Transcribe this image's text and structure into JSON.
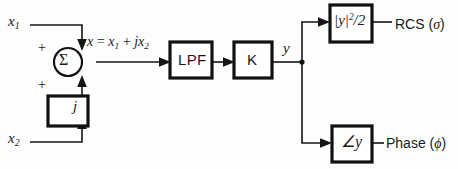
{
  "diagram": {
    "background_color": "#fdfdfd",
    "line_color": "#141414",
    "inputs": [
      {
        "id": "x1",
        "label": "x",
        "subscript": "1",
        "position": "top-left"
      },
      {
        "id": "x2",
        "label": "x",
        "subscript": "2",
        "position": "bottom-left"
      }
    ],
    "summing_junction": {
      "symbol": "Σ",
      "sign_top": "+",
      "sign_bottom": "+"
    },
    "signal_equation": {
      "lhs": "x",
      "eq": "=",
      "term1_base": "x",
      "term1_sub": "1",
      "plus": "+",
      "term2_prefix": "j",
      "term2_base": "x",
      "term2_sub": "2",
      "full": "x = x1 + jx2"
    },
    "blocks": [
      {
        "id": "gain-j",
        "label": "j",
        "style": "math-italic"
      },
      {
        "id": "lpf",
        "label": "LPF",
        "style": "plain"
      },
      {
        "id": "gain-k",
        "label": "K",
        "style": "plain"
      },
      {
        "id": "magnitude-squared",
        "label": "|y|²/2",
        "style": "math-italic"
      },
      {
        "id": "angle",
        "label": "∠y",
        "style": "math-italic"
      }
    ],
    "intermediate_signal": {
      "label": "y"
    },
    "outputs": [
      {
        "id": "rcs",
        "name": "RCS",
        "symbol": "σ",
        "full": "RCS (σ)"
      },
      {
        "id": "phase",
        "name": "Phase",
        "symbol": "ϕ",
        "full": "Phase (ϕ)"
      }
    ],
    "mag_block_text": {
      "bar_open": "|",
      "base": "y",
      "bar_close": "|",
      "exponent": "2",
      "divider": "/",
      "denominator": "2"
    },
    "angle_block_text": {
      "angle_sign": "∠",
      "base": "y"
    }
  }
}
